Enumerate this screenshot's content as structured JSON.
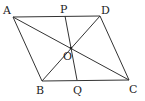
{
  "diagram": {
    "type": "parallelogram with diagonals and transversal",
    "points": {
      "A": {
        "label": "A",
        "x": 13,
        "y": 17
      },
      "D": {
        "label": "D",
        "x": 100,
        "y": 16
      },
      "B": {
        "label": "B",
        "x": 42,
        "y": 81
      },
      "C": {
        "label": "C",
        "x": 129,
        "y": 80
      },
      "O": {
        "label": "O",
        "x": 71,
        "y": 48
      },
      "P": {
        "label": "P",
        "x": 65,
        "y": 16
      },
      "Q": {
        "label": "Q",
        "x": 77,
        "y": 80
      }
    },
    "segments": [
      "AD",
      "AB",
      "BC",
      "DC",
      "AC",
      "BD",
      "PQ"
    ],
    "line_color": "#333333"
  }
}
